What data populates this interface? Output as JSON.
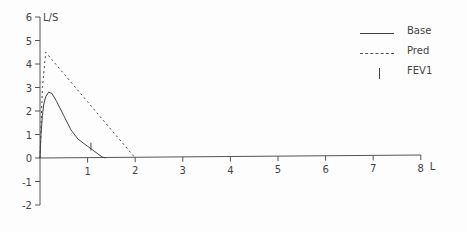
{
  "chart_data": {
    "type": "line",
    "title": "",
    "xlabel": "L",
    "ylabel": "L/S",
    "xlim": [
      0,
      8
    ],
    "ylim": [
      -2,
      6
    ],
    "x_ticks": [
      "1",
      "2",
      "3",
      "4",
      "5",
      "6",
      "7",
      "8"
    ],
    "y_ticks": [
      "6",
      "5",
      "4",
      "3",
      "2",
      "1",
      "0",
      "-1",
      "-2"
    ],
    "grid": false,
    "legend_position": "top-right",
    "series": [
      {
        "name": "Base",
        "style": "solid",
        "x": [
          0.0,
          0.02,
          0.05,
          0.08,
          0.12,
          0.18,
          0.25,
          0.35,
          0.5,
          0.65,
          0.8,
          1.0,
          1.1,
          1.2,
          1.3,
          1.38
        ],
        "y": [
          0.0,
          1.0,
          1.8,
          2.3,
          2.6,
          2.8,
          2.75,
          2.4,
          1.8,
          1.2,
          0.8,
          0.5,
          0.35,
          0.2,
          0.05,
          0.0
        ]
      },
      {
        "name": "Pred",
        "style": "dashed",
        "x": [
          0.0,
          0.05,
          0.12,
          2.0
        ],
        "y": [
          0.0,
          3.0,
          4.5,
          0.0
        ]
      },
      {
        "name": "FEV1",
        "style": "marker",
        "x": [
          1.07
        ],
        "y": [
          0.4
        ]
      }
    ]
  },
  "legend": {
    "items": [
      {
        "label": "Base"
      },
      {
        "label": "Pred"
      },
      {
        "label": "FEV1"
      }
    ]
  }
}
